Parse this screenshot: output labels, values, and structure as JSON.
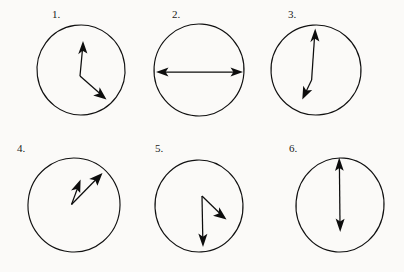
{
  "figure": {
    "background_color": "#fbfaf8",
    "ink_color": "#111111",
    "panel_count": 6
  },
  "panels": [
    {
      "label": "1.",
      "label_pos": {
        "x": 52,
        "y": 18
      },
      "circle": {
        "cx": 81,
        "cy": 70,
        "rx": 44,
        "ry": 45,
        "rotate": -8
      },
      "arrows": [
        {
          "name": "arrow-up",
          "x1": 80,
          "y1": 76,
          "x2": 83,
          "y2": 42,
          "head": "end"
        },
        {
          "name": "arrow-down-right",
          "x1": 80,
          "y1": 76,
          "x2": 106,
          "y2": 99,
          "head": "end"
        }
      ]
    },
    {
      "label": "2.",
      "label_pos": {
        "x": 172,
        "y": 18
      },
      "circle": {
        "cx": 199,
        "cy": 70,
        "rx": 45,
        "ry": 46,
        "rotate": 4
      },
      "arrows": [
        {
          "name": "arrow-horizontal-double",
          "x1": 157,
          "y1": 72,
          "x2": 242,
          "y2": 72,
          "head": "both"
        }
      ]
    },
    {
      "label": "3.",
      "label_pos": {
        "x": 288,
        "y": 18
      },
      "circle": {
        "cx": 316,
        "cy": 70,
        "rx": 45,
        "ry": 45,
        "rotate": -4
      },
      "arrows": [
        {
          "name": "arrow-up-long",
          "x1": 312,
          "y1": 80,
          "x2": 315,
          "y2": 29,
          "head": "end"
        },
        {
          "name": "arrow-down-left-short",
          "x1": 312,
          "y1": 80,
          "x2": 303,
          "y2": 99,
          "head": "end"
        }
      ]
    },
    {
      "label": "4.",
      "label_pos": {
        "x": 17,
        "y": 152
      },
      "circle": {
        "cx": 74,
        "cy": 205,
        "rx": 46,
        "ry": 47,
        "rotate": 6
      },
      "arrows": [
        {
          "name": "arrow-up-right-steep",
          "x1": 72,
          "y1": 204,
          "x2": 80,
          "y2": 180,
          "head": "end"
        },
        {
          "name": "arrow-up-right-shallow",
          "x1": 72,
          "y1": 204,
          "x2": 102,
          "y2": 173,
          "head": "end"
        }
      ]
    },
    {
      "label": "5.",
      "label_pos": {
        "x": 155,
        "y": 152
      },
      "circle": {
        "cx": 199,
        "cy": 206,
        "rx": 44,
        "ry": 46,
        "rotate": -3
      },
      "arrows": [
        {
          "name": "arrow-down-right",
          "x1": 202,
          "y1": 196,
          "x2": 226,
          "y2": 219,
          "head": "end"
        },
        {
          "name": "arrow-down",
          "x1": 202,
          "y1": 196,
          "x2": 203,
          "y2": 246,
          "head": "end"
        }
      ]
    },
    {
      "label": "6.",
      "label_pos": {
        "x": 289,
        "y": 152
      },
      "circle": {
        "cx": 340,
        "cy": 205,
        "rx": 44,
        "ry": 47,
        "rotate": 5
      },
      "arrows": [
        {
          "name": "arrow-vertical-double",
          "x1": 339,
          "y1": 158,
          "x2": 340,
          "y2": 231,
          "head": "both"
        }
      ]
    }
  ]
}
